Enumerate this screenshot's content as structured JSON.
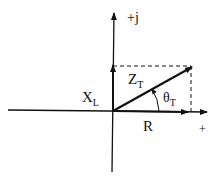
{
  "diagram": {
    "type": "impedance phasor diagram",
    "axes": {
      "imaginary_label": "+j",
      "real_label": "+"
    },
    "vectors": [
      {
        "name": "R",
        "label_main": "R",
        "label_sub": "",
        "direction": "horizontal"
      },
      {
        "name": "X_L",
        "label_main": "X",
        "label_sub": "L",
        "direction": "vertical"
      },
      {
        "name": "Z_T",
        "label_main": "Z",
        "label_sub": "T",
        "direction": "diagonal"
      }
    ],
    "angle": {
      "label_main": "θ",
      "label_sub": "T"
    },
    "colors": {
      "stroke": "#111111",
      "background": "#ffffff"
    }
  }
}
